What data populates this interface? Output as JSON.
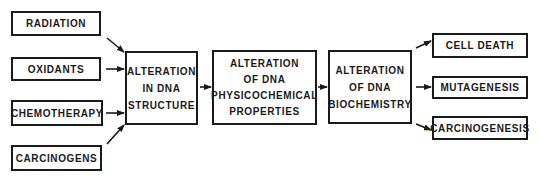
{
  "inputs": [
    {
      "label": "RADIATION"
    },
    {
      "label": "OXIDANTS"
    },
    {
      "label": "CHEMOTHERAPY"
    },
    {
      "label": "CARCINOGENS"
    }
  ],
  "stages": [
    {
      "lines": [
        "ALTERATION",
        "IN DNA",
        "STRUCTURE"
      ]
    },
    {
      "lines": [
        "ALTERATION",
        "OF DNA",
        "PHYSICOCHEMICAL",
        "PROPERTIES"
      ]
    },
    {
      "lines": [
        "ALTERATION",
        "OF DNA",
        "BIOCHEMISTRY"
      ]
    }
  ],
  "outputs": [
    {
      "label": "CELL DEATH"
    },
    {
      "label": "MUTAGENESIS"
    },
    {
      "label": "CARCINOGENESIS"
    }
  ],
  "colors": {
    "stroke": "#1a1a1a",
    "background": "#ffffff"
  }
}
